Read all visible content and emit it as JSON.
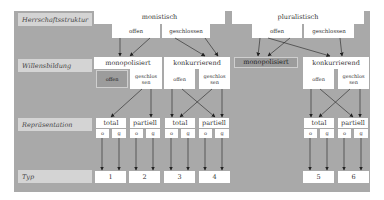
{
  "row_labels": {
    "herrschaft": "Herrschaftsstruktur",
    "willensbildung": "Willensbildung",
    "repraesentation": "Repräsentation",
    "typ": "Typ"
  },
  "herrschaftsstruktur": {
    "monistisch": {
      "label": "monistisch",
      "offen": "offen",
      "geschlossen": "geschlossen"
    },
    "pluralistisch": {
      "label": "pluralistisch",
      "offen": "offen",
      "geschlossen": "geschlossen"
    }
  },
  "willensbildung": {
    "left_monopolisiert": {
      "label": "monopolisiert",
      "offen": "offen",
      "geschlossen": "geschlos sen"
    },
    "left_konkurrierend": {
      "label": "konkurrierend",
      "offen": "offen",
      "geschlossen": "geschlos sen"
    },
    "right_monopolisiert": {
      "label": "monopolisiert"
    },
    "right_konkurrierend": {
      "label": "konkurrierend",
      "offen": "offen",
      "geschlossen": "geschlos sen"
    }
  },
  "repraesentation": [
    {
      "label": "total",
      "o": "o",
      "g": "g"
    },
    {
      "label": "partiell",
      "o": "o",
      "g": "g"
    },
    {
      "label": "total",
      "o": "o",
      "g": "g"
    },
    {
      "label": "partiell",
      "o": "o",
      "g": "g"
    },
    {
      "label": "total",
      "o": "o",
      "g": "g"
    },
    {
      "label": "partiell",
      "o": "o",
      "g": "g"
    }
  ],
  "typ": [
    "1",
    "2",
    "3",
    "4",
    "5",
    "6"
  ],
  "colors": {
    "panel": "#a9a9a9",
    "box": "#ffffff",
    "label": "#d4d4d4",
    "null_box": "#9c9c9c",
    "line": "#222222"
  }
}
